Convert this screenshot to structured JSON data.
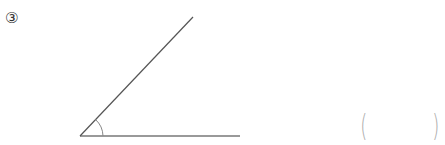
{
  "problem": {
    "number": "③",
    "figure": {
      "type": "angle",
      "vertex": [
        80,
        136
      ],
      "ray_horizontal_end": [
        240,
        136
      ],
      "ray_diagonal_end": [
        193,
        17
      ],
      "arc_marker": true
    },
    "answer_box": {
      "open": "(",
      "close": ")",
      "value": ""
    }
  }
}
